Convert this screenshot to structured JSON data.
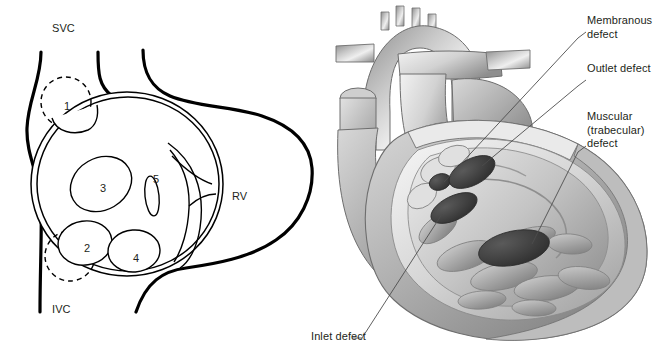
{
  "figure": {
    "panels": [
      "septal-schematic",
      "heart-cutaway"
    ]
  },
  "schematic": {
    "labels": {
      "svc": "SVC",
      "ivc": "IVC",
      "rv": "RV"
    },
    "defect_numbers": [
      {
        "id": "1",
        "text": "1",
        "x": 64,
        "y": 101,
        "outline": "dashed"
      },
      {
        "id": "2",
        "text": "2",
        "x": 84,
        "y": 243,
        "outline": "dashed"
      },
      {
        "id": "3",
        "text": "3",
        "x": 100,
        "y": 183,
        "outline": "solid"
      },
      {
        "id": "4",
        "text": "4",
        "x": 133,
        "y": 253,
        "outline": "solid"
      },
      {
        "id": "5",
        "text": "5",
        "x": 153,
        "y": 174,
        "outline": "solid"
      }
    ]
  },
  "cutaway": {
    "callouts": [
      {
        "id": "membranous",
        "lines": [
          "Membranous",
          "defect"
        ],
        "x": 587,
        "y": 16
      },
      {
        "id": "outlet",
        "lines": [
          "Outlet defect"
        ],
        "x": 587,
        "y": 64
      },
      {
        "id": "muscular",
        "lines": [
          "Muscular",
          "(trabecular)",
          "defect"
        ],
        "x": 587,
        "y": 112
      },
      {
        "id": "inlet",
        "lines": [
          "Inlet defect"
        ],
        "x": 311,
        "y": 330
      }
    ]
  },
  "colors": {
    "ink": "#231f20",
    "line": "#000000",
    "shade_light": "#d9d9d9",
    "shade_mid": "#a8a8a8",
    "shade_dark": "#6e6e6e",
    "defect_fill": "#3d3d3d",
    "background": "#ffffff"
  }
}
